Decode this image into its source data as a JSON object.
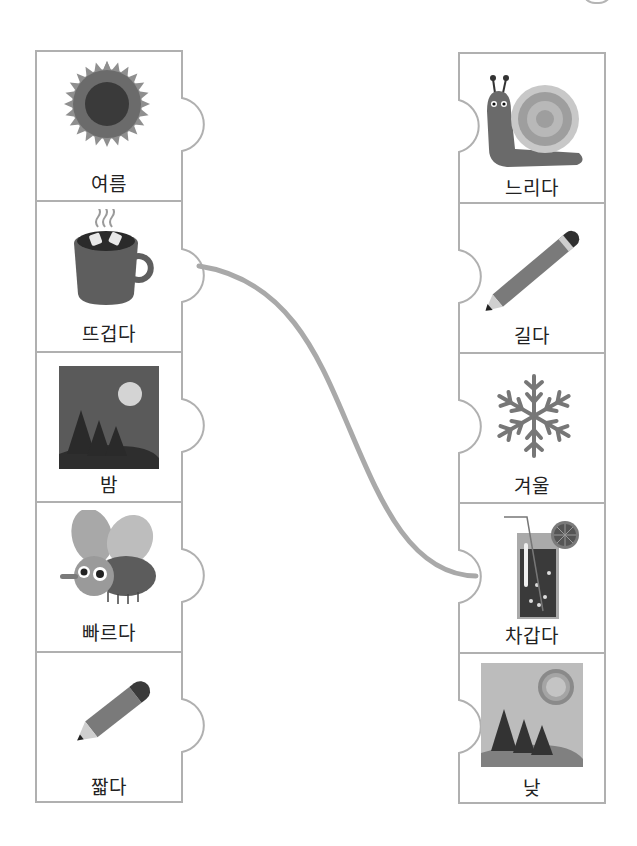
{
  "worksheet": {
    "type": "picture-matching-activity",
    "colors": {
      "border": "#b0b0b0",
      "line": "#a9a9a9",
      "text": "#222222"
    },
    "left_column": [
      {
        "label": "여름",
        "icon": "sun-icon"
      },
      {
        "label": "뜨겁다",
        "icon": "hot-cocoa-mug-icon"
      },
      {
        "label": "밤",
        "icon": "night-forest-moon-icon"
      },
      {
        "label": "빠르다",
        "icon": "fly-icon"
      },
      {
        "label": "짧다",
        "icon": "short-pencil-icon"
      }
    ],
    "right_column": [
      {
        "label": "느리다",
        "icon": "snail-icon"
      },
      {
        "label": "길다",
        "icon": "long-pencil-icon"
      },
      {
        "label": "겨울",
        "icon": "snowflake-icon"
      },
      {
        "label": "차갑다",
        "icon": "iced-drink-icon"
      },
      {
        "label": "낮",
        "icon": "day-forest-sun-icon"
      }
    ],
    "connections": [
      {
        "from": "뜨겁다",
        "to": "차갑다"
      }
    ]
  }
}
